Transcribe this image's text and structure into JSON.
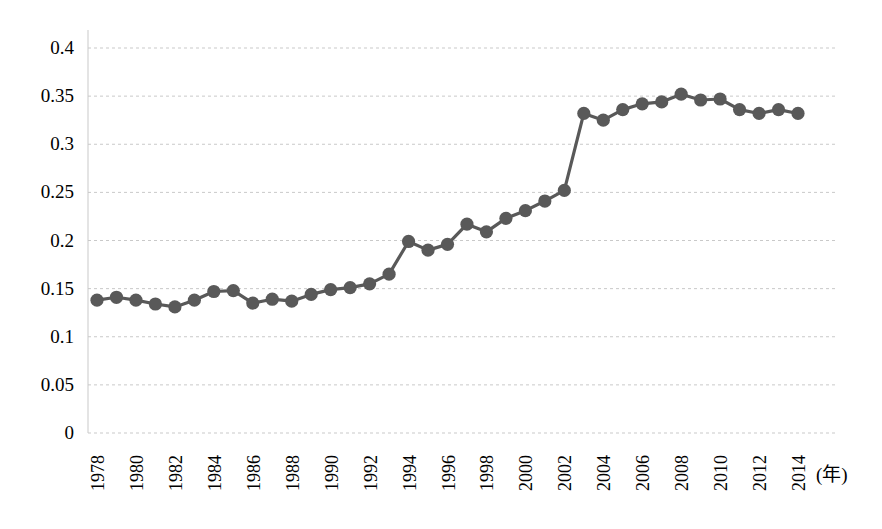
{
  "chart_data": {
    "type": "line",
    "title": "",
    "subtitle": "",
    "xlabel": "(年)",
    "ylabel": "",
    "xlim": [
      1977.4,
      2015.2
    ],
    "ylim": [
      0,
      0.4
    ],
    "grid": true,
    "legend": null,
    "legend_position": "none",
    "series_color": "#595959",
    "marker": "circle",
    "x": [
      1978,
      1979,
      1980,
      1981,
      1982,
      1983,
      1984,
      1985,
      1986,
      1987,
      1988,
      1989,
      1990,
      1991,
      1992,
      1993,
      1994,
      1995,
      1996,
      1997,
      1998,
      1999,
      2000,
      2001,
      2002,
      2003,
      2004,
      2005,
      2006,
      2007,
      2008,
      2009,
      2010,
      2011,
      2012,
      2013,
      2014
    ],
    "values": [
      0.138,
      0.141,
      0.138,
      0.134,
      0.131,
      0.138,
      0.147,
      0.148,
      0.135,
      0.139,
      0.137,
      0.144,
      0.149,
      0.151,
      0.155,
      0.165,
      0.199,
      0.19,
      0.196,
      0.217,
      0.209,
      0.223,
      0.231,
      0.241,
      0.252,
      0.332,
      0.325,
      0.336,
      0.342,
      0.344,
      0.352,
      0.346,
      0.347,
      0.336,
      0.332,
      0.336,
      0.332
    ],
    "ytick_labels": [
      "0.4",
      "0.35",
      "0.3",
      "0.25",
      "0.2",
      "0.15",
      "0.1",
      "0.05",
      "0"
    ],
    "ytick_values": [
      0.4,
      0.35,
      0.3,
      0.25,
      0.2,
      0.15,
      0.1,
      0.05,
      0
    ],
    "xtick_labels": [
      "1978",
      "1980",
      "1982",
      "1984",
      "1986",
      "1988",
      "1990",
      "1992",
      "1994",
      "1996",
      "1998",
      "2000",
      "2002",
      "2004",
      "2006",
      "2008",
      "2010",
      "2012",
      "2014"
    ],
    "xtick_values": [
      1978,
      1980,
      1982,
      1984,
      1986,
      1988,
      1990,
      1992,
      1994,
      1996,
      1998,
      2000,
      2002,
      2004,
      2006,
      2008,
      2010,
      2012,
      2014
    ]
  }
}
